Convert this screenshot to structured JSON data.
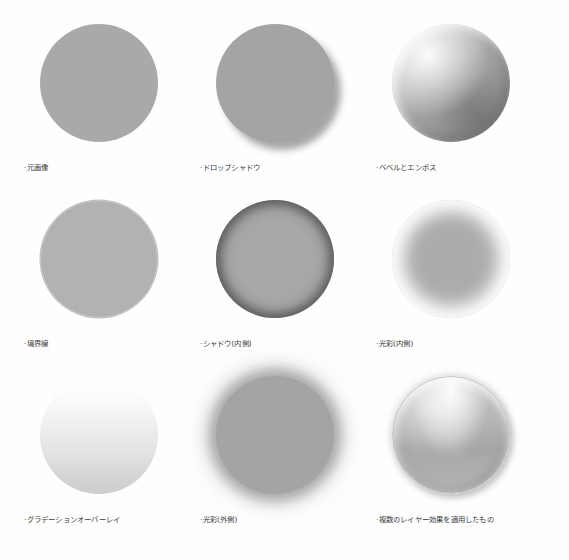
{
  "page": {
    "background_color": "#fefefe",
    "caption_color": "#3b3b3b",
    "base_shape_color": "#a9a9a9",
    "columns": 3,
    "rows": 3
  },
  "samples": [
    {
      "id": "original",
      "label": "·元画像",
      "effect": "none",
      "shape": "circle",
      "fill": "#a9a9a9"
    },
    {
      "id": "drop-shadow",
      "label": "·ドロップシャドウ",
      "effect": "drop-shadow",
      "shape": "circle",
      "fill": "#a4a4a4"
    },
    {
      "id": "bevel-emboss",
      "label": "·ベベルとエンボス",
      "effect": "bevel-and-emboss",
      "shape": "circle",
      "fill": "#aaaaaa"
    },
    {
      "id": "stroke",
      "label": "·境界線",
      "effect": "stroke",
      "shape": "circle",
      "fill": "#b2b2b2"
    },
    {
      "id": "inner-shadow",
      "label": "·シャドウ(内側)",
      "effect": "inner-shadow",
      "shape": "circle",
      "fill": "#a9a9a9"
    },
    {
      "id": "inner-glow",
      "label": "·光彩(内側)",
      "effect": "inner-glow",
      "shape": "circle",
      "fill": "#ababab"
    },
    {
      "id": "gradient-overlay",
      "label": "·グラデーションオーバーレイ",
      "effect": "gradient-overlay",
      "shape": "circle",
      "fill": "#e1e1e1"
    },
    {
      "id": "outer-glow",
      "label": "·光彩(外側)",
      "effect": "outer-glow",
      "shape": "circle",
      "fill": "#a4a4a4"
    },
    {
      "id": "multiple-effects",
      "label": "·複数のレイヤー効果を適用したもの",
      "effect": "multiple",
      "shape": "circle",
      "fill": "#b6b6b6"
    }
  ]
}
